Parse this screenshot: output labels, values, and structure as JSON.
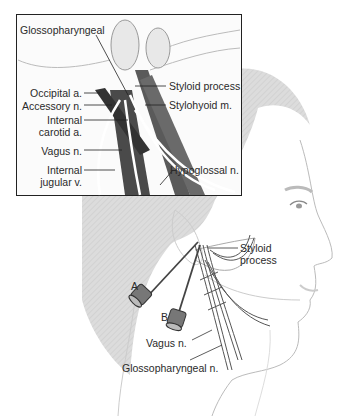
{
  "figure": {
    "inset_labels": {
      "glossopharyngeal": "Glossopharyngeal",
      "occipital": "Occipital a.",
      "accessory": "Accessory n.",
      "internal_carotid_1": "Internal",
      "internal_carotid_2": "carotid a.",
      "vagus": "Vagus n.",
      "internal_jugular_1": "Internal",
      "internal_jugular_2": "jugular v.",
      "styloid": "Styloid process",
      "stylohyoid": "Stylohyoid m.",
      "hypoglossal": "Hypoglossal n."
    },
    "main_labels": {
      "styloid_1": "Styloid",
      "styloid_2": "process",
      "needle_a": "A",
      "needle_b": "B",
      "vagus": "Vagus n.",
      "glossopharyngeal": "Glossopharyngeal n."
    },
    "colors": {
      "hair_gray": "#d9d9d9",
      "muscle_dark": "#4a4a4a",
      "outline": "#222222"
    }
  }
}
